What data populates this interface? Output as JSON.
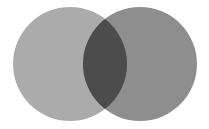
{
  "figure": {
    "kind": "venn-diagram",
    "title": "",
    "width": 209,
    "height": 129,
    "background_color": "#ffffff"
  },
  "chart_data": {
    "type": "venn",
    "title": "",
    "xlabel": "",
    "ylabel": "",
    "grid": false,
    "legend": "none",
    "background": "#ffffff",
    "sets": [
      {
        "name": "set-a",
        "label": "",
        "fill": "#ababab",
        "cx": 70,
        "cy": 64,
        "r": 57
      },
      {
        "name": "set-b",
        "label": "",
        "fill": "#8e8e8e",
        "cx": 140,
        "cy": 64,
        "r": 57
      }
    ],
    "intersection": {
      "name": "set-a-and-set-b",
      "label": "",
      "fill": "#4c4c4c",
      "x_extent": [
        83,
        127
      ],
      "y_extent": [
        19,
        109
      ]
    },
    "colors": {
      "left": "#ababab",
      "right": "#8e8e8e",
      "overlap": "#4c4c4c",
      "background": "#ffffff"
    }
  }
}
